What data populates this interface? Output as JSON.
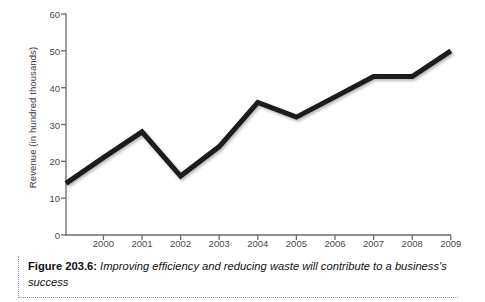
{
  "figure": {
    "caption_label": "Figure 203.6:",
    "caption_text": " Improving efficiency and reducing waste will contribute to a business's success"
  },
  "chart_data": {
    "type": "line",
    "title": "",
    "subtitle": "",
    "xlabel": "",
    "ylabel": "Revenue (in hundred thousands)",
    "categories": [
      "2000",
      "2001",
      "2002",
      "2003",
      "2004",
      "2005",
      "2006",
      "2007",
      "2008",
      "2009"
    ],
    "values": [
      21,
      28,
      16,
      24,
      36,
      32,
      37.5,
      43,
      43,
      50
    ],
    "origin_value": 14,
    "series": [
      {
        "name": "Revenue",
        "values": [
          21,
          28,
          16,
          24,
          36,
          32,
          37.5,
          43,
          43,
          50
        ],
        "color": "#1a1a1a"
      }
    ],
    "xlim": [
      1999,
      2009
    ],
    "ylim": [
      0,
      60
    ],
    "ytick_labels": [
      "0",
      "10",
      "20",
      "30",
      "40",
      "50",
      "60"
    ],
    "ytick_values": [
      0,
      10,
      20,
      30,
      40,
      50,
      60
    ],
    "xtick_labels": [
      "2000",
      "2001",
      "2002",
      "2003",
      "2004",
      "2005",
      "2006",
      "2007",
      "2008",
      "2009"
    ],
    "grid": false,
    "legend": "none",
    "line_width": 5,
    "axis_color": "#6b6b6b"
  }
}
